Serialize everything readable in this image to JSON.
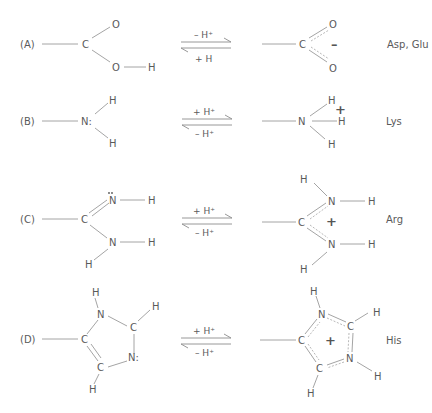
{
  "figure": {
    "rows": [
      {
        "label": "(A)",
        "residue": "Asp, Glu",
        "forward": "– H⁺",
        "reverse": "+ H",
        "left_atoms": {
          "c": "C",
          "o1": "O",
          "o2": "O",
          "h": "H"
        },
        "right_atoms": {
          "c": "C",
          "o1": "O",
          "o2": "O"
        },
        "right_charge": "–"
      },
      {
        "label": "(B)",
        "residue": "Lys",
        "forward": "+ H⁺",
        "reverse": "– H⁺",
        "left_atoms": {
          "n": "N:",
          "h1": "H",
          "h2": "H"
        },
        "right_atoms": {
          "n": "N",
          "h1": "H",
          "h2": "H",
          "h3": "H"
        },
        "right_charge": "+"
      },
      {
        "label": "(C)",
        "residue": "Arg",
        "forward": "+ H⁺",
        "reverse": "– H⁺",
        "left_atoms": {
          "c": "C",
          "n1": "N",
          "n2": "N",
          "h1": "H",
          "h2": "H",
          "h3": "H"
        },
        "right_atoms": {
          "c": "C",
          "n1": "N",
          "n2": "N",
          "h1": "H",
          "h2": "H",
          "h3": "H",
          "h4": "H"
        },
        "right_charge": "+"
      },
      {
        "label": "(D)",
        "residue": "His",
        "forward": "+ H⁺",
        "reverse": "– H⁺",
        "left_atoms": {
          "c1": "C",
          "c2": "C",
          "c3": "C",
          "n1": "N",
          "n2": "N:",
          "h1": "H",
          "h2": "H",
          "h3": "H"
        },
        "right_atoms": {
          "c1": "C",
          "c2": "C",
          "c3": "C",
          "n1": "N",
          "n2": "N",
          "h1": "H",
          "h2": "H",
          "h3": "H",
          "h4": "H"
        },
        "right_charge": "+"
      }
    ]
  }
}
